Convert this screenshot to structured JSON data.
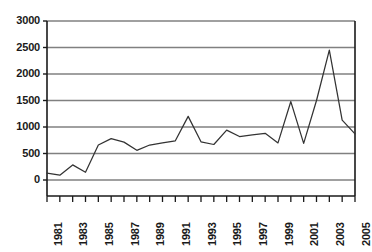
{
  "chart_data": {
    "type": "line",
    "title": "",
    "subtitle": "",
    "xlabel": "",
    "ylabel": "",
    "grid": true,
    "legend": false,
    "legend_position": "none",
    "xlim": [
      1981,
      2005
    ],
    "ylim": [
      0,
      3000
    ],
    "ytick_labels": [
      "0",
      "500",
      "1000",
      "1500",
      "2000",
      "2500",
      "3000"
    ],
    "ytick_values": [
      0,
      500,
      1000,
      1500,
      2000,
      2500,
      3000
    ],
    "xtick_labels": [
      "1981",
      "1983",
      "1985",
      "1987",
      "1989",
      "1991",
      "1993",
      "1995",
      "1997",
      "1999",
      "2001",
      "2003",
      "2005"
    ],
    "xtick_values": [
      1981,
      1983,
      1985,
      1987,
      1989,
      1991,
      1993,
      1995,
      1997,
      1999,
      2001,
      2003,
      2005
    ],
    "x": [
      1981,
      1982,
      1983,
      1984,
      1985,
      1986,
      1987,
      1988,
      1989,
      1990,
      1991,
      1992,
      1993,
      1994,
      1995,
      1996,
      1997,
      1998,
      1999,
      2000,
      2001,
      2002,
      2003,
      2004,
      2005
    ],
    "values": [
      130,
      90,
      285,
      145,
      660,
      780,
      715,
      560,
      660,
      700,
      740,
      1200,
      720,
      670,
      940,
      820,
      850,
      880,
      700,
      1480,
      690,
      1500,
      2450,
      1130,
      870
    ],
    "series": [
      {
        "name": "series-1",
        "values": [
          130,
          90,
          285,
          145,
          660,
          780,
          715,
          560,
          660,
          700,
          740,
          1200,
          720,
          670,
          940,
          820,
          850,
          880,
          700,
          1480,
          690,
          1500,
          2450,
          1130,
          870
        ]
      }
    ],
    "colors": {
      "line": "#333333",
      "grid": "#808080",
      "axis": "#1a1a1a",
      "background": "#ffffff",
      "text": "#1a1a1a"
    }
  }
}
